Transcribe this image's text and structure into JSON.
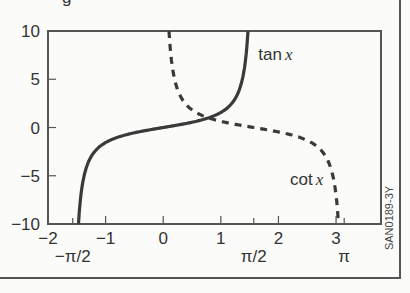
{
  "title_fragment": "g",
  "figure_code": "SAN0189-3Y",
  "chart_data": {
    "type": "line",
    "title": "",
    "xlabel": "",
    "ylabel": "",
    "xlim": [
      -2,
      3.78
    ],
    "ylim": [
      -10,
      10
    ],
    "grid": false,
    "x_ticks": [
      -2,
      -1,
      0,
      1,
      2,
      3
    ],
    "x_tick_labels": [
      "−2",
      "−1",
      "0",
      "1",
      "2",
      "3"
    ],
    "x_special_ticks": [
      {
        "value": -1.5708,
        "label": "−π/2"
      },
      {
        "value": 1.5708,
        "label": "π/2"
      },
      {
        "value": 3.1416,
        "label": "π"
      }
    ],
    "y_ticks": [
      10,
      5,
      0,
      -5,
      -10
    ],
    "y_tick_labels": [
      "10",
      "5",
      "0",
      "−5",
      "−10"
    ],
    "series": [
      {
        "name": "tan x",
        "style": "solid",
        "x_range": [
          -1.471,
          1.471
        ],
        "function": "tan"
      },
      {
        "name": "cot x",
        "style": "dashed",
        "x_range": [
          0.0997,
          3.0419
        ],
        "function": "cot"
      }
    ],
    "annotations": [
      {
        "text": "tan x",
        "x": 1.65,
        "y": 7
      },
      {
        "text": "cot x",
        "x": 2.2,
        "y": -6
      }
    ]
  }
}
